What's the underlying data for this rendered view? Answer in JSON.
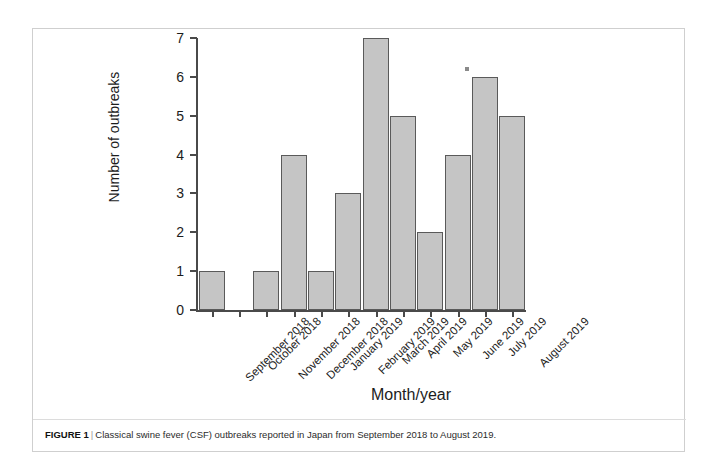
{
  "figure": {
    "caption_label": "FIGURE 1",
    "caption_separator": "|",
    "caption_text": "Classical swine fever (CSF) outbreaks reported in Japan from September 2018 to August 2019."
  },
  "chart_data": {
    "type": "bar",
    "title": "",
    "xlabel": "Month/year",
    "ylabel": "Number of outbreaks",
    "categories": [
      "September 2018",
      "October 2018",
      "November 2018",
      "December 2018",
      "January 2019",
      "February 2019",
      "March 2019",
      "April 2019",
      "May 2019",
      "June 2019",
      "July 2019",
      "August 2019"
    ],
    "values": [
      1,
      0,
      1,
      4,
      1,
      3,
      7,
      5,
      2,
      4,
      6,
      5
    ],
    "ylim": [
      0,
      7
    ],
    "yticks": [
      0,
      1,
      2,
      3,
      4,
      5,
      6,
      7
    ],
    "grid": false,
    "legend": false,
    "bar_color": "#c5c5c5",
    "bar_edge_color": "#5a5a5a",
    "axis_color": "#4a4a4a"
  }
}
